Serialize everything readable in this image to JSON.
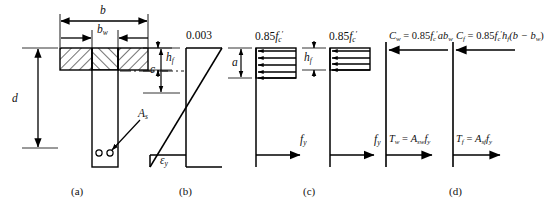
{
  "figure": {
    "type": "engineering-diagram",
    "panels": [
      {
        "id": "a",
        "caption": "(a)",
        "name": "cross-section",
        "labels": [
          {
            "name": "flange-width-b",
            "text": "b"
          },
          {
            "name": "web-width-bw",
            "text": "bw"
          },
          {
            "name": "flange-thickness-hf",
            "text": "hf"
          },
          {
            "name": "effective-depth-d",
            "text": "d"
          },
          {
            "name": "steel-area-As",
            "text": "As"
          }
        ]
      },
      {
        "id": "b",
        "caption": "(b)",
        "name": "strain-diagram",
        "labels": [
          {
            "name": "max-concrete-strain",
            "text": "0.003"
          },
          {
            "name": "neutral-axis-depth-c",
            "text": "c"
          },
          {
            "name": "steel-yield-strain",
            "text": "ey"
          }
        ]
      },
      {
        "id": "c",
        "caption": "(c)",
        "name": "stress-distribution",
        "labels": [
          {
            "name": "web-stress-block-magnitude",
            "text": "0.85fc'"
          },
          {
            "name": "stress-block-depth-a",
            "text": "a"
          },
          {
            "name": "web-steel-stress",
            "text": "fy"
          },
          {
            "name": "flange-stress-block-magnitude",
            "text": "0.85fc'"
          },
          {
            "name": "flange-thickness-hf",
            "text": "hf"
          },
          {
            "name": "flange-steel-stress",
            "text": "fy"
          }
        ]
      },
      {
        "id": "d",
        "caption": "(d)",
        "name": "force-resultants",
        "labels": [
          {
            "name": "web-compression-force",
            "text": "Cw = 0.85fc'abw"
          },
          {
            "name": "web-tension-force",
            "text": "Tw = Aswfy"
          },
          {
            "name": "flange-compression-force",
            "text": "Cf = 0.85fc'hf(b − bw)"
          },
          {
            "name": "flange-tension-force",
            "text": "Tf = Asffy"
          }
        ]
      }
    ],
    "text_values": {
      "b": "b",
      "bw_base": "b",
      "bw_sub": "w",
      "hf_base": "h",
      "hf_sub": "f",
      "d": "d",
      "As_base": "A",
      "As_sub": "s",
      "strain_max": "0.003",
      "c": "c",
      "eps": "ε",
      "eps_sub": "y",
      "stress_085": "0.85",
      "fc_base": "f",
      "fc_sub": "c",
      "fc_prime": "′",
      "a": "a",
      "fy_base": "f",
      "fy_sub": "y",
      "Cw_base": "C",
      "Cw_sub": "w",
      "eq": " = ",
      "abw": "ab",
      "abw_sub": "w",
      "Tw_base": "T",
      "Tw_sub": "w",
      "Asw_base": "A",
      "Asw_sub": "sw",
      "Cf_base": "C",
      "Cf_sub": "f",
      "hf_expr_base": "h",
      "hf_expr_sub": "f",
      "paren_expr": "(b − b",
      "paren_sub": "w",
      "paren_close": ")",
      "Tf_base": "T",
      "Tf_sub": "f",
      "Asf_base": "A",
      "Asf_sub": "sf",
      "cap_a": "(a)",
      "cap_b": "(b)",
      "cap_c": "(c)",
      "cap_d": "(d)"
    },
    "colors": {
      "line": "#000000",
      "background": "#ffffff",
      "text": "#111111"
    }
  }
}
